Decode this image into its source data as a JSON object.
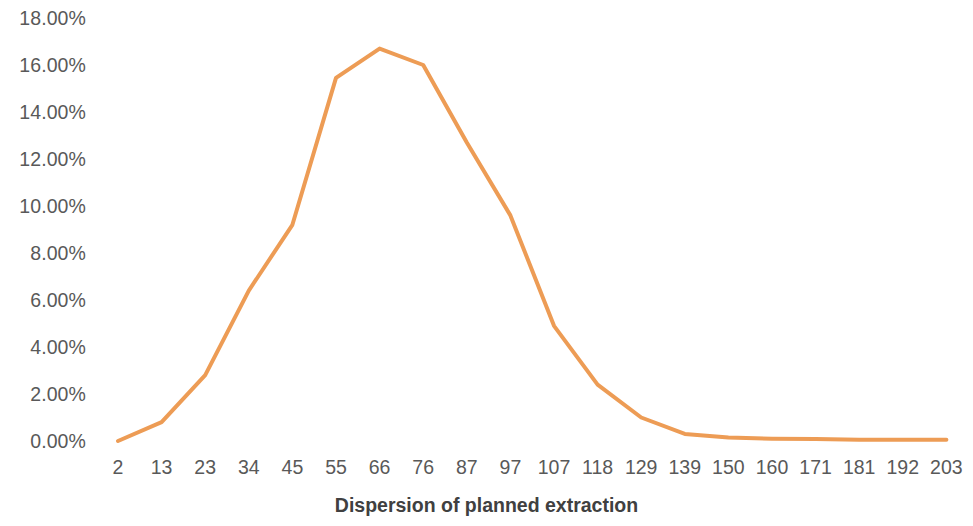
{
  "chart_data": {
    "type": "line",
    "title": "",
    "subtitle": "",
    "xlabel": "Dispersion of planned extraction",
    "ylabel": "",
    "categories": [
      "2",
      "13",
      "23",
      "34",
      "45",
      "55",
      "66",
      "76",
      "87",
      "97",
      "107",
      "118",
      "129",
      "139",
      "150",
      "160",
      "171",
      "181",
      "192",
      "203"
    ],
    "series": [
      {
        "name": "Dispersion of planned extraction",
        "color": "#ED9C55",
        "values": [
          0.0,
          0.8,
          2.8,
          6.4,
          9.2,
          15.45,
          16.7,
          16.0,
          12.7,
          9.6,
          4.9,
          2.4,
          1.0,
          0.3,
          0.15,
          0.1,
          0.08,
          0.05,
          0.05,
          0.05
        ]
      }
    ],
    "y_tick_labels": [
      "18.00%",
      "16.00%",
      "14.00%",
      "12.00%",
      "10.00%",
      "8.00%",
      "6.00%",
      "4.00%",
      "2.00%",
      "0.00%"
    ],
    "y_tick_values": [
      18,
      16,
      14,
      12,
      10,
      8,
      6,
      4,
      2,
      0
    ],
    "ylim": [
      0,
      18
    ],
    "y_tick_step": 2,
    "y_unit": "%",
    "grid": false,
    "markers": false,
    "legend": "none",
    "line_width": 4,
    "accent_color": "#ED9C55",
    "axis_text_color": "#595959",
    "axis_title_color": "#404040",
    "background_color": "#FFFFFF"
  }
}
